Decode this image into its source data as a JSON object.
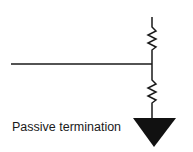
{
  "diagram": {
    "title_label": "Passive termination",
    "colors": {
      "stroke": "#1a1a1a",
      "ground_fill": "#111111",
      "background": "#ffffff"
    },
    "components": [
      {
        "type": "signal-line",
        "orientation": "horizontal"
      },
      {
        "type": "resistor",
        "position": "upper",
        "connects": "supply-to-line"
      },
      {
        "type": "resistor",
        "position": "lower",
        "connects": "line-to-ground"
      },
      {
        "type": "ground-symbol",
        "shape": "filled-triangle"
      }
    ]
  }
}
